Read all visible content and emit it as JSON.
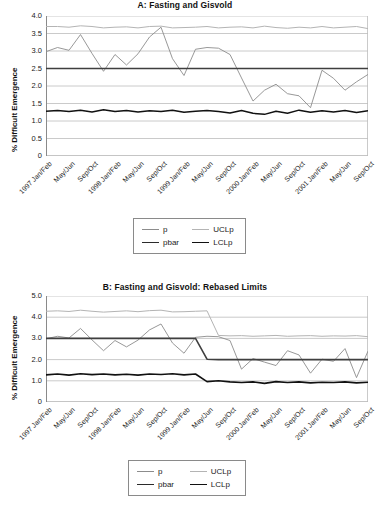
{
  "chart_data": [
    {
      "type": "line",
      "id": "panel-a",
      "title": "A: Fasting and Gisvold",
      "xlabel": "",
      "ylabel": "% Difficult Emergence",
      "ylim": [
        0,
        4.0
      ],
      "yticks": [
        "0",
        "0.5",
        "1.0",
        "1.5",
        "2.0",
        "2.5",
        "3.0",
        "3.5",
        "4.0"
      ],
      "ytick_values": [
        0,
        0.5,
        1.0,
        1.5,
        2.0,
        2.5,
        3.0,
        3.5,
        4.0
      ],
      "grid": true,
      "legend_position": "below",
      "categories": [
        "1997 Jan/Feb",
        "Mar/Apr",
        "May/Jun",
        "Jul/Aug",
        "Sep/Oct",
        "Nov/Dec",
        "1998 Jan/Feb",
        "Mar/Apr",
        "May/Jun",
        "Jul/Aug",
        "Sep/Oct",
        "Nov/Dec",
        "1999 Jan/Feb",
        "Mar/Apr",
        "May/Jun",
        "Jul/Aug",
        "Sep/Oct",
        "Nov/Dec",
        "2000 Jan/Feb",
        "Mar/Apr",
        "May/Jun",
        "Jul/Aug",
        "Sep/Oct",
        "Nov/Dec",
        "2001 Jan/Feb",
        "Mar/Apr",
        "May/Jun",
        "Jul/Aug",
        "Sep/Oct"
      ],
      "xtick_labels": [
        "1997 Jan/Feb",
        "May/Jun",
        "Sep/Oct",
        "1998 Jan/Feb",
        "May/Jun",
        "Sep/Oct",
        "1999 Jan/Feb",
        "May/Jun",
        "Sep/Oct",
        "2000 Jan/Feb",
        "May/Jun",
        "Sep/Oct",
        "2001 Jan/Feb",
        "May/Jun",
        "Sep/Oct"
      ],
      "xtick_indices": [
        0,
        2,
        4,
        6,
        8,
        10,
        12,
        14,
        16,
        18,
        20,
        22,
        24,
        26,
        28
      ],
      "series": [
        {
          "name": "p",
          "color": "#8c8c8c",
          "width": 0.9,
          "values": [
            2.98,
            3.1,
            3.02,
            3.47,
            2.93,
            2.42,
            2.9,
            2.6,
            2.92,
            3.4,
            3.68,
            2.78,
            2.3,
            3.05,
            3.1,
            3.08,
            2.9,
            2.23,
            1.57,
            1.88,
            2.05,
            1.78,
            1.72,
            1.38,
            2.45,
            2.22,
            1.88,
            2.12,
            2.33
          ]
        },
        {
          "name": "UCLp",
          "color": "#b4b4b4",
          "width": 1.0,
          "values": [
            3.7,
            3.7,
            3.68,
            3.72,
            3.7,
            3.66,
            3.68,
            3.69,
            3.66,
            3.7,
            3.71,
            3.66,
            3.67,
            3.68,
            3.7,
            3.66,
            3.68,
            3.69,
            3.66,
            3.71,
            3.67,
            3.65,
            3.68,
            3.66,
            3.7,
            3.66,
            3.68,
            3.7,
            3.64
          ]
        },
        {
          "name": "pbar",
          "color": "#3f3f3f",
          "width": 1.4,
          "values": [
            2.5,
            2.5,
            2.5,
            2.5,
            2.5,
            2.5,
            2.5,
            2.5,
            2.5,
            2.5,
            2.5,
            2.5,
            2.5,
            2.5,
            2.5,
            2.5,
            2.5,
            2.5,
            2.5,
            2.5,
            2.5,
            2.5,
            2.5,
            2.5,
            2.5,
            2.5,
            2.5,
            2.5,
            2.5
          ]
        },
        {
          "name": "LCLp",
          "color": "#111111",
          "width": 1.5,
          "values": [
            1.28,
            1.3,
            1.27,
            1.31,
            1.26,
            1.32,
            1.27,
            1.3,
            1.26,
            1.29,
            1.27,
            1.31,
            1.25,
            1.28,
            1.3,
            1.27,
            1.23,
            1.3,
            1.22,
            1.19,
            1.28,
            1.22,
            1.31,
            1.25,
            1.29,
            1.26,
            1.3,
            1.24,
            1.29
          ]
        }
      ]
    },
    {
      "type": "line",
      "id": "panel-b",
      "title": "B: Fasting and Gisvold: Rebased Limits",
      "xlabel": "",
      "ylabel": "% Difficult Emergence",
      "ylim": [
        0,
        5.0
      ],
      "yticks": [
        "0",
        "1.0",
        "2.0",
        "3.0",
        "4.0",
        "5.0"
      ],
      "ytick_values": [
        0,
        1.0,
        2.0,
        3.0,
        4.0,
        5.0
      ],
      "grid": true,
      "legend_position": "below",
      "categories": [
        "1997 Jan/Feb",
        "Mar/Apr",
        "May/Jun",
        "Jul/Aug",
        "Sep/Oct",
        "Nov/Dec",
        "1998 Jan/Feb",
        "Mar/Apr",
        "May/Jun",
        "Jul/Aug",
        "Sep/Oct",
        "Nov/Dec",
        "1999 Jan/Feb",
        "Mar/Apr",
        "May/Jun",
        "Jul/Aug",
        "Sep/Oct",
        "Nov/Dec",
        "2000 Jan/Feb",
        "Mar/Apr",
        "May/Jun",
        "Jul/Aug",
        "Sep/Oct",
        "Nov/Dec",
        "2001 Jan/Feb",
        "Mar/Apr",
        "May/Jun",
        "Jul/Aug",
        "Sep/Oct"
      ],
      "xtick_labels": [
        "1997 Jan/Feb",
        "May/Jun",
        "Sep/Oct",
        "1998 Jan/Feb",
        "May/Jun",
        "Sep/Oct",
        "1999 Jan/Feb",
        "May/Jun",
        "Sep/Oct",
        "2000 Jan/Feb",
        "May/Jun",
        "Sep/Oct",
        "2001 Jan/Feb",
        "May/Jun",
        "Sep/Oct"
      ],
      "xtick_indices": [
        0,
        2,
        4,
        6,
        8,
        10,
        12,
        14,
        16,
        18,
        20,
        22,
        24,
        26,
        28
      ],
      "rebase_index": 14,
      "series": [
        {
          "name": "p",
          "color": "#8c8c8c",
          "width": 0.9,
          "values": [
            2.98,
            3.1,
            3.02,
            3.47,
            2.93,
            2.42,
            2.9,
            2.6,
            2.92,
            3.4,
            3.68,
            2.78,
            2.3,
            3.05,
            3.1,
            3.08,
            2.9,
            1.55,
            2.05,
            1.88,
            1.72,
            2.42,
            2.22,
            1.36,
            2.02,
            1.92,
            2.52,
            1.15,
            2.4,
            2.38,
            2.05,
            2.5,
            2.32
          ]
        },
        {
          "name": "UCLp",
          "color": "#b4b4b4",
          "width": 1.0,
          "values": [
            4.28,
            4.3,
            4.27,
            4.33,
            4.28,
            4.24,
            4.27,
            4.3,
            4.26,
            4.31,
            4.33,
            4.25,
            4.26,
            4.28,
            4.3,
            3.14,
            3.12,
            3.13,
            3.1,
            3.12,
            3.14,
            3.1,
            3.12,
            3.13,
            3.1,
            3.12,
            3.11,
            3.13,
            3.08
          ]
        },
        {
          "name": "pbar",
          "color": "#3f3f3f",
          "width": 1.6,
          "values": [
            3.0,
            3.0,
            3.0,
            3.0,
            3.0,
            3.0,
            3.0,
            3.0,
            3.0,
            3.0,
            3.0,
            3.0,
            3.0,
            3.0,
            2.02,
            2.0,
            2.0,
            2.0,
            2.0,
            2.0,
            2.0,
            2.0,
            2.0,
            2.0,
            2.0,
            2.0,
            2.0,
            2.0,
            2.0
          ]
        },
        {
          "name": "LCLp",
          "color": "#111111",
          "width": 1.6,
          "values": [
            1.28,
            1.32,
            1.27,
            1.33,
            1.29,
            1.32,
            1.28,
            1.31,
            1.27,
            1.32,
            1.3,
            1.33,
            1.28,
            1.32,
            0.96,
            1.0,
            0.95,
            0.92,
            0.95,
            0.88,
            0.96,
            0.92,
            0.95,
            0.9,
            0.93,
            0.92,
            0.95,
            0.9,
            0.93
          ]
        }
      ]
    }
  ],
  "legend": {
    "items": [
      {
        "label": "p",
        "color": "#8c8c8c",
        "width": "1px"
      },
      {
        "label": "UCLp",
        "color": "#b4b4b4",
        "width": "1px"
      },
      {
        "label": "pbar",
        "color": "#2b2b2b",
        "width": "1.6px"
      },
      {
        "label": "LCLp",
        "color": "#111111",
        "width": "1.8px"
      }
    ]
  },
  "colors": {
    "grid": "#bcbcbc",
    "axis": "#8a8a8a",
    "text": "#1a1a1a",
    "background": "#ffffff"
  }
}
